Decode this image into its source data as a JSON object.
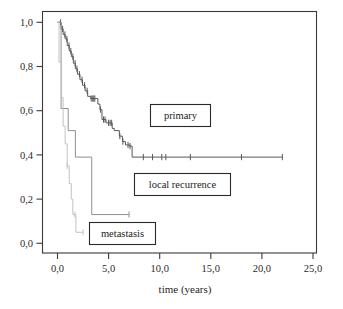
{
  "chart_data": {
    "type": "line",
    "title": "",
    "xlabel": "time (years)",
    "ylabel": "",
    "xlim": [
      0,
      25
    ],
    "ylim": [
      0,
      1.0
    ],
    "grid": false,
    "legend_position": "inside-boxes",
    "x_tick_labels": [
      "0,0",
      "5,0",
      "10,0",
      "15,0",
      "20,0",
      "25,0"
    ],
    "x_tick_values": [
      0,
      5,
      10,
      15,
      20,
      25
    ],
    "y_tick_labels": [
      "0,0",
      "0,2",
      "0,4",
      "0,6",
      "0,8",
      "1,0"
    ],
    "y_tick_values": [
      0.0,
      0.2,
      0.4,
      0.6,
      0.8,
      1.0
    ],
    "series": [
      {
        "name": "primary",
        "color": "#585858",
        "points": [
          [
            0.0,
            1.0
          ],
          [
            0.35,
            1.0
          ],
          [
            0.35,
            0.97
          ],
          [
            0.55,
            0.97
          ],
          [
            0.55,
            0.945
          ],
          [
            0.75,
            0.945
          ],
          [
            0.75,
            0.925
          ],
          [
            0.95,
            0.925
          ],
          [
            0.95,
            0.895
          ],
          [
            1.15,
            0.895
          ],
          [
            1.15,
            0.87
          ],
          [
            1.35,
            0.87
          ],
          [
            1.35,
            0.845
          ],
          [
            1.55,
            0.845
          ],
          [
            1.55,
            0.815
          ],
          [
            1.75,
            0.815
          ],
          [
            1.75,
            0.79
          ],
          [
            1.95,
            0.79
          ],
          [
            1.95,
            0.765
          ],
          [
            2.2,
            0.765
          ],
          [
            2.2,
            0.74
          ],
          [
            2.45,
            0.74
          ],
          [
            2.45,
            0.715
          ],
          [
            2.7,
            0.715
          ],
          [
            2.7,
            0.69
          ],
          [
            2.95,
            0.69
          ],
          [
            2.95,
            0.665
          ],
          [
            3.25,
            0.665
          ],
          [
            3.25,
            0.655
          ],
          [
            3.95,
            0.655
          ],
          [
            3.95,
            0.63
          ],
          [
            4.15,
            0.63
          ],
          [
            4.15,
            0.605
          ],
          [
            4.35,
            0.605
          ],
          [
            4.35,
            0.56
          ],
          [
            4.75,
            0.56
          ],
          [
            4.75,
            0.545
          ],
          [
            5.35,
            0.545
          ],
          [
            5.35,
            0.52
          ],
          [
            5.55,
            0.52
          ],
          [
            5.55,
            0.51
          ],
          [
            6.05,
            0.51
          ],
          [
            6.05,
            0.485
          ],
          [
            6.35,
            0.485
          ],
          [
            6.35,
            0.46
          ],
          [
            6.65,
            0.46
          ],
          [
            6.65,
            0.445
          ],
          [
            7.05,
            0.445
          ],
          [
            7.05,
            0.44
          ],
          [
            7.3,
            0.44
          ],
          [
            7.3,
            0.39
          ],
          [
            22.0,
            0.39
          ]
        ],
        "censor_times": [
          0.3,
          0.5,
          0.72,
          0.92,
          1.12,
          1.3,
          1.5,
          1.72,
          1.9,
          2.15,
          2.4,
          2.65,
          2.9,
          3.3,
          3.45,
          3.55,
          3.65,
          4.2,
          4.5,
          4.65,
          5.0,
          5.15,
          5.3,
          6.1,
          6.4,
          6.9,
          7.1,
          8.4,
          9.3,
          10.2,
          10.6,
          13.0,
          18.0,
          22.0
        ],
        "plateau_value": 0.39
      },
      {
        "name": "local recurrence",
        "color": "#8f8f8f",
        "points": [
          [
            0.0,
            1.0
          ],
          [
            0.35,
            1.0
          ],
          [
            0.35,
            0.61
          ],
          [
            1.05,
            0.61
          ],
          [
            1.05,
            0.51
          ],
          [
            1.75,
            0.51
          ],
          [
            1.75,
            0.39
          ],
          [
            3.35,
            0.39
          ],
          [
            3.35,
            0.13
          ],
          [
            7.0,
            0.13
          ]
        ],
        "censor_times": [
          7.0
        ],
        "plateau_value": 0.13
      },
      {
        "name": "metastasis",
        "color": "#c2c2c2",
        "points": [
          [
            0.0,
            1.0
          ],
          [
            0.15,
            1.0
          ],
          [
            0.15,
            0.82
          ],
          [
            0.4,
            0.82
          ],
          [
            0.4,
            0.66
          ],
          [
            0.55,
            0.66
          ],
          [
            0.55,
            0.53
          ],
          [
            0.75,
            0.53
          ],
          [
            0.75,
            0.45
          ],
          [
            0.95,
            0.45
          ],
          [
            0.95,
            0.35
          ],
          [
            1.15,
            0.35
          ],
          [
            1.15,
            0.27
          ],
          [
            1.35,
            0.27
          ],
          [
            1.35,
            0.2
          ],
          [
            1.5,
            0.2
          ],
          [
            1.5,
            0.13
          ],
          [
            1.8,
            0.13
          ],
          [
            1.8,
            0.05
          ],
          [
            2.5,
            0.05
          ]
        ],
        "censor_times": [
          0.95,
          1.7,
          2.5
        ],
        "plateau_value": 0.05
      }
    ],
    "annotations": [
      {
        "id": "primary",
        "label": "primary",
        "x_center": 15.0,
        "y_center": 0.525
      },
      {
        "id": "local_recurrence",
        "label": "local recurrence",
        "x_center": 12.6,
        "y_center": 0.245
      },
      {
        "id": "metastasis",
        "label": "metastasis",
        "x_center": 6.6,
        "y_center": 0.048
      }
    ]
  },
  "axes": {
    "x_axis_title": "time (years)",
    "x_ticks": [
      "0,0",
      "5,0",
      "10,0",
      "15,0",
      "20,0",
      "25,0"
    ],
    "y_ticks": [
      "1,0",
      "0,8",
      "0,6",
      "0,4",
      "0,2",
      "0,0"
    ]
  },
  "labels": {
    "primary": "primary",
    "local_recurrence": "local recurrence",
    "metastasis": "metastasis"
  },
  "colors": {
    "primary": "#585858",
    "local_recurrence": "#8f8f8f",
    "metastasis": "#c2c2c2",
    "frame": "#3a3a3a",
    "text": "#1c1c1c",
    "background": "#ffffff"
  }
}
